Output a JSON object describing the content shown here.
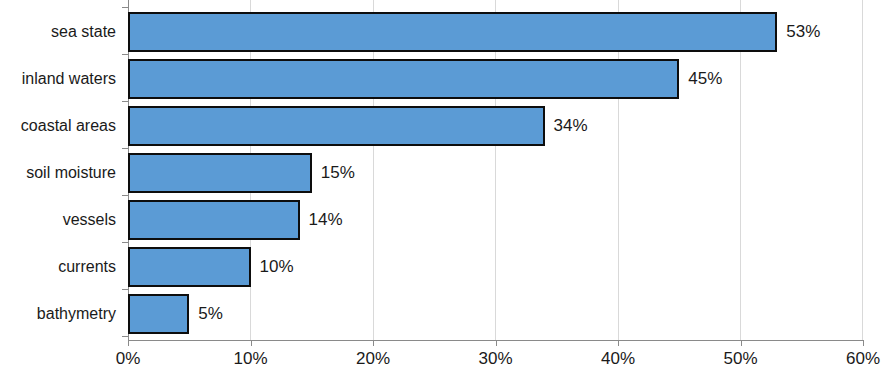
{
  "chart_data": {
    "type": "bar",
    "orientation": "horizontal",
    "title": "",
    "xlabel": "",
    "ylabel": "",
    "xlim": [
      0,
      60
    ],
    "grid": true,
    "legend": false,
    "categories": [
      "sea state",
      "inland waters",
      "coastal areas",
      "soil moisture",
      "vessels",
      "currents",
      "bathymetry"
    ],
    "values": [
      53,
      45,
      34,
      15,
      14,
      10,
      5
    ],
    "value_labels": [
      "53%",
      "45%",
      "34%",
      "15%",
      "14%",
      "10%",
      "5%"
    ],
    "xticks": [
      0,
      10,
      20,
      30,
      40,
      50,
      60
    ],
    "xtick_labels": [
      "0%",
      "10%",
      "20%",
      "30%",
      "40%",
      "50%",
      "60%"
    ],
    "colors": {
      "bar_fill": "#5B9BD5",
      "bar_border": "#0D0D0D",
      "gridline": "#D9D9D9",
      "axis": "#8A8A8A",
      "text": "#1A1A1A",
      "background": "#FFFFFF"
    }
  }
}
